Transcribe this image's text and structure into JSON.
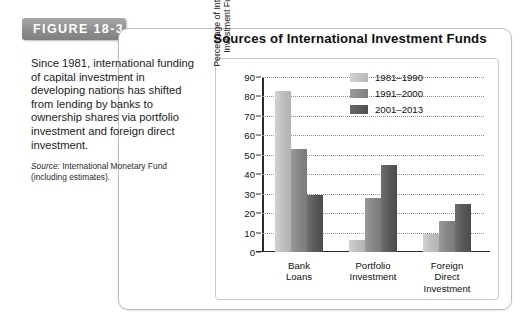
{
  "figure": {
    "tab_label": "FIGURE 18-3"
  },
  "caption": {
    "body": "Since 1981, international funding of capital investment in developing nations has shifted from lending by banks to ownership shares via portfolio investment and foreign direct investment.",
    "source_label": "Source:",
    "source_text": " International Monetary Fund (including estimates)."
  },
  "colors": {
    "series_1981_1990": "#bdbdbd",
    "series_1991_2000": "#858585",
    "series_2001_2013": "#575757",
    "tab_gray": "#8e8e8e",
    "axis": "#2b2b2b",
    "grid": "#909090"
  },
  "chart_data": {
    "type": "bar",
    "title": "Sources of International Investment Funds",
    "xlabel": "",
    "ylabel": "Percentage of International\nInvestment Funding",
    "categories": [
      "Bank\nLoans",
      "Portfolio\nInvestment",
      "Foreign\nDirect\nInvestment"
    ],
    "series": [
      {
        "name": "1981–1990",
        "values": [
          83,
          6,
          9.5
        ]
      },
      {
        "name": "1991–2000",
        "values": [
          53,
          28,
          16
        ]
      },
      {
        "name": "2001–2013",
        "values": [
          29.5,
          44.5,
          24.5
        ]
      }
    ],
    "ylim": [
      0,
      90
    ],
    "yticks": [
      0,
      10,
      20,
      30,
      40,
      50,
      60,
      70,
      80,
      90
    ],
    "ytick_labels": [
      "0",
      "10",
      "20",
      "30",
      "40",
      "50",
      "60",
      "70",
      "80",
      "90"
    ],
    "grid": true,
    "grid_style": "dotted",
    "legend_position": "top-right"
  }
}
